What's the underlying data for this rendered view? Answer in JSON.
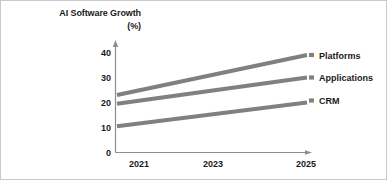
{
  "chart_data": {
    "type": "line",
    "title": "AI Software Growth",
    "subtitle": "(%)",
    "xlabel": "",
    "ylabel": "(%)",
    "x": [
      2021,
      2025
    ],
    "xticks": [
      "2021",
      "2023",
      "2025"
    ],
    "xtick_values": [
      2021,
      2023,
      2025
    ],
    "yticks": [
      "0",
      "10",
      "20",
      "30",
      "40"
    ],
    "ytick_values": [
      0,
      10,
      20,
      30,
      40
    ],
    "xlim": [
      2021,
      2025
    ],
    "ylim": [
      0,
      40
    ],
    "grid": false,
    "legend_position": "right-inline",
    "line_color": "#808080",
    "series": [
      {
        "name": "Platforms",
        "values": [
          23,
          39
        ],
        "label_y": 38.5
      },
      {
        "name": "Applications",
        "values": [
          19.5,
          30
        ],
        "label_y": 29.5
      },
      {
        "name": "CRM",
        "values": [
          10.5,
          20
        ],
        "label_y": 20.5
      }
    ]
  },
  "labels": {
    "series_0": "Platforms",
    "series_1": "Applications",
    "series_2": "CRM",
    "ytick_0": "0",
    "ytick_1": "10",
    "ytick_2": "20",
    "ytick_3": "30",
    "ytick_4": "40",
    "xtick_0": "2021",
    "xtick_1": "2023",
    "xtick_2": "2025"
  },
  "colors": {
    "line": "#808080",
    "axis": "#8d8d8d",
    "text": "#1a1a1a",
    "border": "#c9c9c9",
    "background": "#ffffff"
  }
}
